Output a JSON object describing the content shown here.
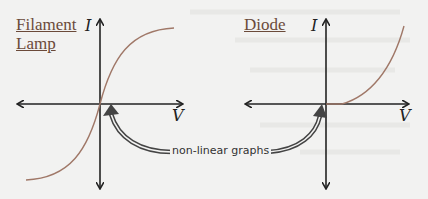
{
  "graphs": [
    {
      "title_line1": "Filament",
      "title_line2": "Lamp",
      "y_axis_label": "I",
      "x_axis_label": "V",
      "curve": "s-shaped (steep through origin, flattening at extremes)"
    },
    {
      "title_line1": "Diode",
      "y_axis_label": "I",
      "x_axis_label": "V",
      "curve": "zero for negative V, rising sharply for positive V"
    }
  ],
  "annotation": {
    "label": "non-linear graphs"
  },
  "colors": {
    "background": "#f2f2f1",
    "axes": "#222222",
    "curve": "#a07868",
    "title": "#6b4a3a",
    "arrow_fill": "#555555"
  }
}
